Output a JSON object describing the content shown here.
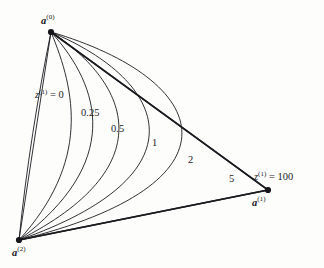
{
  "figure": {
    "type": "contour-diagram",
    "background_color": "#fdfdfc",
    "line_color": "#1b1b1f",
    "vertices": [
      {
        "id": "a0",
        "label_base": "a",
        "label_sup": "(0)",
        "x": 51,
        "y": 32,
        "label_x": 41,
        "label_y": 14
      },
      {
        "id": "a1",
        "label_base": "a",
        "label_sup": "(1)",
        "x": 268,
        "y": 190,
        "label_x": 252,
        "label_y": 196
      },
      {
        "id": "a2",
        "label_base": "a",
        "label_sup": "(2)",
        "x": 19,
        "y": 240,
        "label_x": 12,
        "label_y": 246
      }
    ],
    "level_labels": [
      {
        "id": "z0",
        "text_prefix": "z",
        "text_sup": "(1)",
        "text_suffix": " = 0",
        "value": "0",
        "x": 35,
        "y": 88
      },
      {
        "id": "z025",
        "text": "0.25",
        "value": "0.25",
        "x": 81,
        "y": 108
      },
      {
        "id": "z05",
        "text": "0.5",
        "value": "0.5",
        "x": 111,
        "y": 124
      },
      {
        "id": "z1",
        "text": "1",
        "value": "1",
        "x": 152,
        "y": 138
      },
      {
        "id": "z2",
        "text": "2",
        "value": "2",
        "x": 188,
        "y": 155
      },
      {
        "id": "z5",
        "text": "5",
        "value": "5",
        "x": 229,
        "y": 174
      },
      {
        "id": "z100",
        "text_prefix": "z",
        "text_sup": "(1)",
        "text_suffix": " = 100",
        "value": "100",
        "x": 254,
        "y": 170
      }
    ]
  },
  "chart_data": {
    "type": "line",
    "title": "",
    "xlabel": "",
    "ylabel": "",
    "contour_variable": "z^(1)",
    "levels": [
      "0",
      "0.25",
      "0.5",
      "1",
      "2",
      "5",
      "100"
    ],
    "triangle_vertices": {
      "a0": [
        51,
        32
      ],
      "a1": [
        268,
        190
      ],
      "a2": [
        19,
        240
      ]
    },
    "series": [
      {
        "name": "0",
        "value": 0,
        "path": "M51,32 C38,95 26,170 19,240"
      },
      {
        "name": "0.25",
        "value": 0.25,
        "path": "M51,32 C76,92 90,162 19,240"
      },
      {
        "name": "0.5",
        "value": 0.5,
        "path": "M51,32 C102,88 122,163 19,240"
      },
      {
        "name": "1",
        "value": 1,
        "path": "M51,32 C132,85 162,168 19,240"
      },
      {
        "name": "2",
        "value": 2,
        "path": "M51,32 C170,82 205,175 19,240"
      },
      {
        "name": "5",
        "value": 5,
        "path": "M51,32 C214,80 248,184 19,240"
      },
      {
        "name": "100",
        "value": 100,
        "path": "M51,32 L268,190 L19,240"
      }
    ],
    "grid": false,
    "legend": "none"
  }
}
